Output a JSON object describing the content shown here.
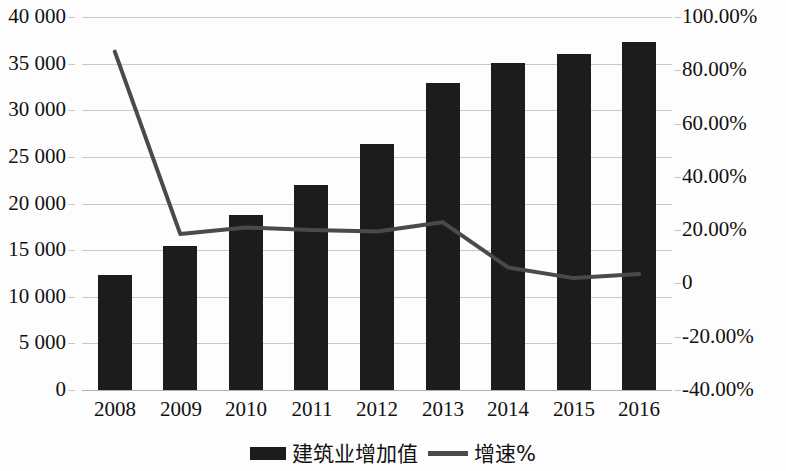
{
  "chart_data": {
    "type": "bar",
    "title": "",
    "subtitle": "",
    "xlabel": "",
    "ylabel": "",
    "categories": [
      "2008",
      "2009",
      "2010",
      "2011",
      "2012",
      "2013",
      "2014",
      "2015",
      "2016"
    ],
    "series": [
      {
        "name": "建筑业增加值",
        "type": "bar",
        "axis": "left",
        "values": [
          12300,
          15400,
          18800,
          22000,
          26400,
          32900,
          35100,
          36000,
          37300
        ]
      },
      {
        "name": "增速%",
        "type": "line",
        "axis": "right",
        "values": [
          87.0,
          18.5,
          21.0,
          20.0,
          19.5,
          23.0,
          6.0,
          2.0,
          3.5
        ]
      }
    ],
    "y_left": {
      "min": 0,
      "max": 40000,
      "step": 5000,
      "ticks": [
        "0",
        "5 000",
        "10 000",
        "15 000",
        "20 000",
        "25 000",
        "30 000",
        "35 000",
        "40 000"
      ]
    },
    "y_right": {
      "min": -40,
      "max": 100,
      "step": 20,
      "ticks": [
        "-40.00%",
        "-20.00%",
        "0",
        "20.00%",
        "40.00%",
        "60.00%",
        "80.00%",
        "100.00%"
      ]
    },
    "grid": true,
    "legend_position": "bottom",
    "legend": [
      {
        "label": "建筑业增加值",
        "marker": "bar-swatch",
        "color": "#1c1c1c"
      },
      {
        "label": "增速%",
        "marker": "line-swatch",
        "color": "#4a4a4a"
      }
    ],
    "colors": {
      "bar": "#1c1c1c",
      "line": "#4a4a4a",
      "grid": "#c9c9c9",
      "background": "#fdfdfd",
      "text": "#111111"
    }
  }
}
